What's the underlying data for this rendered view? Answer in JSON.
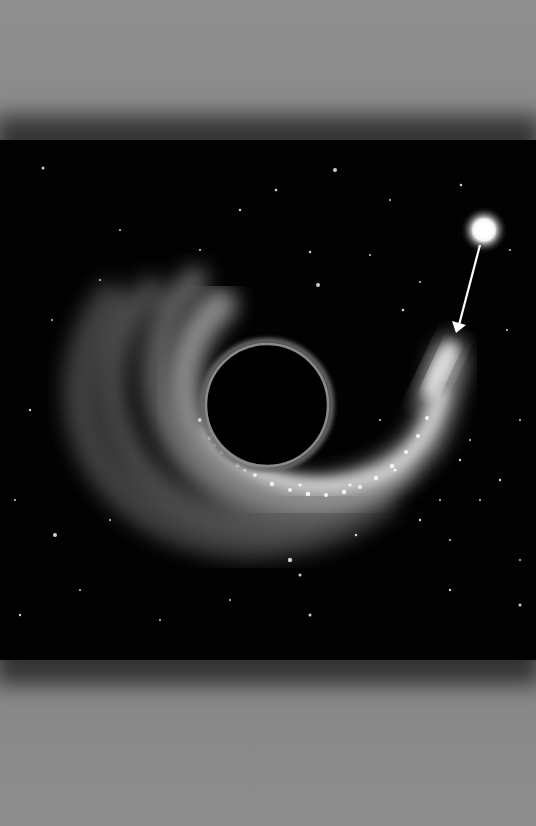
{
  "image": {
    "subject": "Illustration of a black hole tidally disrupting a star",
    "elements": [
      "black-hole-event-horizon",
      "spiral-accretion-stream",
      "tidal-tail-of-disrupted-star",
      "bright-star",
      "arrow-from-star-to-stream"
    ],
    "colors": {
      "paper": "#8f8f8f",
      "space": "#020202",
      "glow": "#e8e8e8",
      "ring": "#7a7a7a"
    }
  }
}
